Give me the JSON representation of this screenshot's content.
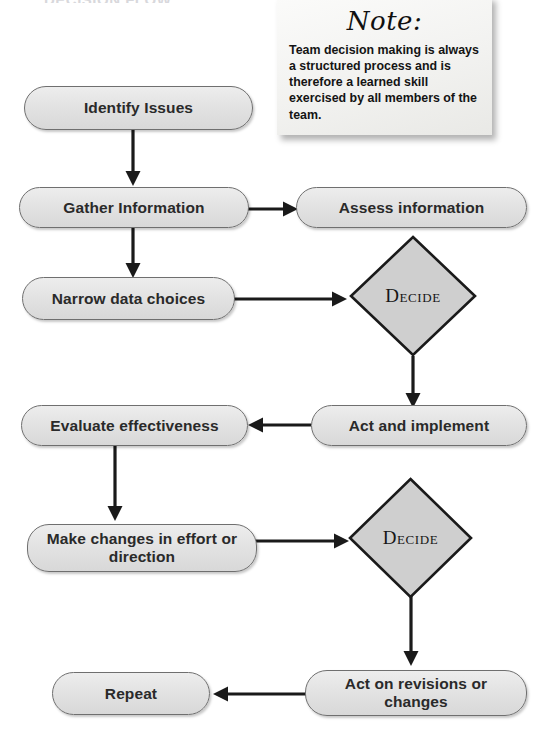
{
  "page": {
    "title_partial": "DECISION FLOW",
    "background_color": "#ffffff"
  },
  "note": {
    "heading": "Note:",
    "body": "Team decision making is always a structured process and is therefore a learned skill exercised by all members of the team."
  },
  "style": {
    "node_fill": "#e3e3e3",
    "node_border": "#6f6f6f",
    "diamond_fill": "#cfcfcf",
    "diamond_border": "#1a1a1a",
    "arrow_color": "#1a1a1a",
    "text_color": "#2a2a2a"
  },
  "flowchart": {
    "type": "flowchart",
    "nodes": [
      {
        "id": "identify",
        "shape": "rounded-rect",
        "label": "Identify Issues"
      },
      {
        "id": "gather",
        "shape": "rounded-rect",
        "label": "Gather Information"
      },
      {
        "id": "assess",
        "shape": "rounded-rect",
        "label": "Assess information"
      },
      {
        "id": "narrow",
        "shape": "rounded-rect",
        "label": "Narrow data choices"
      },
      {
        "id": "decide1",
        "shape": "diamond",
        "label": "Decide"
      },
      {
        "id": "act",
        "shape": "rounded-rect",
        "label": "Act and implement"
      },
      {
        "id": "evaluate",
        "shape": "rounded-rect",
        "label": "Evaluate effectiveness"
      },
      {
        "id": "makechange",
        "shape": "rounded-rect",
        "label": "Make changes in effort or direction"
      },
      {
        "id": "decide2",
        "shape": "diamond",
        "label": "Decide"
      },
      {
        "id": "actrev",
        "shape": "rounded-rect",
        "label": "Act on revisions or changes"
      },
      {
        "id": "repeat",
        "shape": "rounded-rect",
        "label": "Repeat"
      }
    ],
    "edges": [
      {
        "from": "identify",
        "to": "gather",
        "direction": "down"
      },
      {
        "from": "gather",
        "to": "assess",
        "direction": "right"
      },
      {
        "from": "gather",
        "to": "narrow",
        "direction": "down"
      },
      {
        "from": "narrow",
        "to": "decide1",
        "direction": "right"
      },
      {
        "from": "decide1",
        "to": "act",
        "direction": "down"
      },
      {
        "from": "act",
        "to": "evaluate",
        "direction": "left"
      },
      {
        "from": "evaluate",
        "to": "makechange",
        "direction": "down"
      },
      {
        "from": "makechange",
        "to": "decide2",
        "direction": "right"
      },
      {
        "from": "decide2",
        "to": "actrev",
        "direction": "down"
      },
      {
        "from": "actrev",
        "to": "repeat",
        "direction": "left"
      }
    ]
  }
}
